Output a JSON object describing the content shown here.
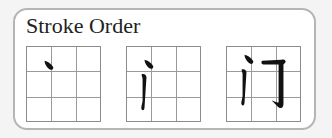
{
  "title": "Stroke Order",
  "character": "门",
  "frames": [
    {
      "step": 1,
      "strokes_shown": 1
    },
    {
      "step": 2,
      "strokes_shown": 2
    },
    {
      "step": 3,
      "strokes_shown": 3
    }
  ],
  "colors": {
    "stroke": "#111111",
    "grid": "#9a9a9a",
    "panel_border": "#b5b5b5"
  }
}
